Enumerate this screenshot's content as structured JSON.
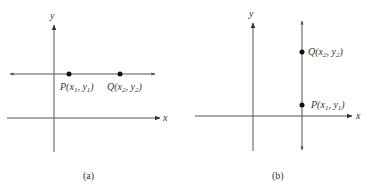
{
  "panels": [
    {
      "caption": "(a)",
      "axis_labels": {
        "x": "x",
        "y": "y"
      },
      "line": "horizontal",
      "points": [
        {
          "name": "P",
          "coord": "x₁, y₁",
          "label": "P(x1, y1)"
        },
        {
          "name": "Q",
          "coord": "x₂, y₂",
          "label": "Q(x2, y2)"
        }
      ]
    },
    {
      "caption": "(b)",
      "axis_labels": {
        "x": "x",
        "y": "y"
      },
      "line": "vertical",
      "points": [
        {
          "name": "Q",
          "coord": "x₂, y₂",
          "label": "Q(x2, y2)"
        },
        {
          "name": "P",
          "coord": "x₁, y₁",
          "label": "P(x1, y1)"
        }
      ]
    }
  ],
  "colors": {
    "line": "#555555",
    "point": "#111111",
    "text": "#333333"
  }
}
